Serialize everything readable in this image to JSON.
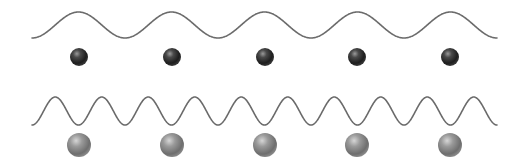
{
  "diagram": {
    "colors": {
      "background": "#ffffff",
      "wave_stroke": "#6b6b6b",
      "dark_sphere": "#2e2e2e",
      "light_sphere": "#8a8a8a"
    },
    "rows": [
      {
        "name": "low-frequency",
        "wave": {
          "x_start": 32,
          "x_end": 497,
          "y_trough": 38,
          "y_peak": 12,
          "period": 93,
          "cycles": 5
        },
        "spheres": {
          "count": 5,
          "centers_x": [
            79,
            172,
            265,
            357,
            450
          ],
          "center_y": 57,
          "radius": 9,
          "tone": "dark"
        }
      },
      {
        "name": "high-frequency",
        "wave": {
          "x_start": 32,
          "x_end": 497,
          "y_trough": 125,
          "y_peak": 97,
          "period": 46.5,
          "cycles": 10
        },
        "spheres": {
          "count": 5,
          "centers_x": [
            79,
            172,
            265,
            357,
            450
          ],
          "center_y": 145,
          "radius": 12,
          "tone": "light"
        }
      }
    ]
  }
}
